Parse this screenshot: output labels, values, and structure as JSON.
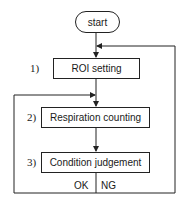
{
  "diagram": {
    "type": "flowchart",
    "start": {
      "label": "start"
    },
    "steps": [
      {
        "number": "1)",
        "label": "ROI setting"
      },
      {
        "number": "2)",
        "label": "Respiration counting"
      },
      {
        "number": "3)",
        "label": "Condition judgement"
      }
    ],
    "branches": {
      "ok": "OK",
      "ng": "NG"
    },
    "edges": [
      {
        "from": "start",
        "to": "ROI setting"
      },
      {
        "from": "ROI setting",
        "to": "Respiration counting"
      },
      {
        "from": "Respiration counting",
        "to": "Condition judgement"
      },
      {
        "from": "Condition judgement",
        "to": "Respiration counting",
        "label": "OK"
      },
      {
        "from": "Condition judgement",
        "to": "ROI setting",
        "label": "NG"
      }
    ]
  }
}
